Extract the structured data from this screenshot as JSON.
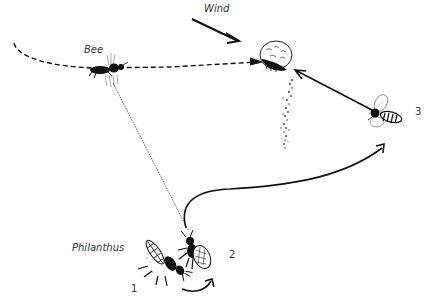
{
  "labels": {
    "wind": "Wind",
    "bee": "Bee",
    "philanthus": "Philanthus",
    "stage_1": "1",
    "stage_2": "2",
    "stage_3": "3"
  },
  "colors": {
    "ink": "#111111",
    "background": "#ffffff"
  },
  "elements": {
    "bee_path": "dashed-flight-path",
    "sight_line": "dotted-line-wasp-to-bee",
    "flower": "flower-head",
    "scent_plume": "scent-trail",
    "wasp_flight": "solid-curve-2-to-3",
    "approach": "arrow-3-to-flower"
  }
}
